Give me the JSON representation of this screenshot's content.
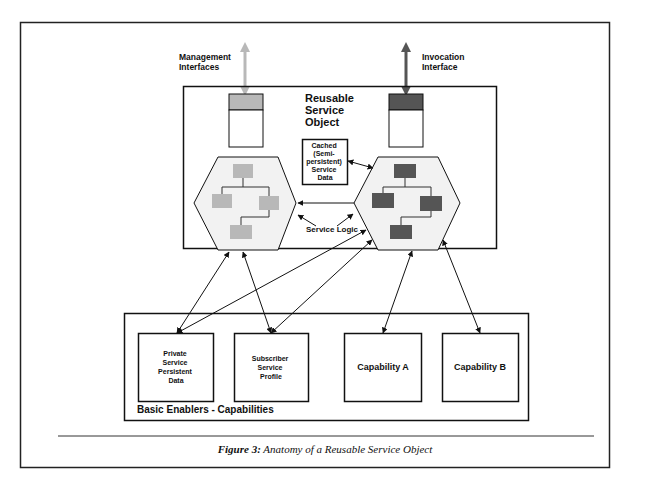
{
  "figure": {
    "caption_label": "Figure 3:",
    "caption_text": " Anatomy of a Reusable Service Object"
  },
  "interfaces": {
    "management": [
      "Management",
      "Interfaces"
    ],
    "invocation": [
      "Invocation",
      "Interface"
    ]
  },
  "rso": {
    "title": [
      "Reusable",
      "Service",
      "Object"
    ],
    "cached": [
      "Cached",
      "(Semi-",
      "persistent)",
      "Service",
      "Data"
    ],
    "service_logic": "Service Logic"
  },
  "enablers": {
    "title": "Basic Enablers - Capabilities",
    "boxes": [
      {
        "lines": [
          "Private",
          "Service",
          "Persistent",
          "Data"
        ]
      },
      {
        "lines": [
          "Subscriber",
          "Service",
          "Profile"
        ]
      },
      {
        "lines": [
          "Capability A"
        ]
      },
      {
        "lines": [
          "Capability B"
        ]
      }
    ]
  },
  "colors": {
    "management": "#b8b8b8",
    "invocation": "#555555",
    "hexfill": "#f2f2f2",
    "line": "#111111"
  }
}
